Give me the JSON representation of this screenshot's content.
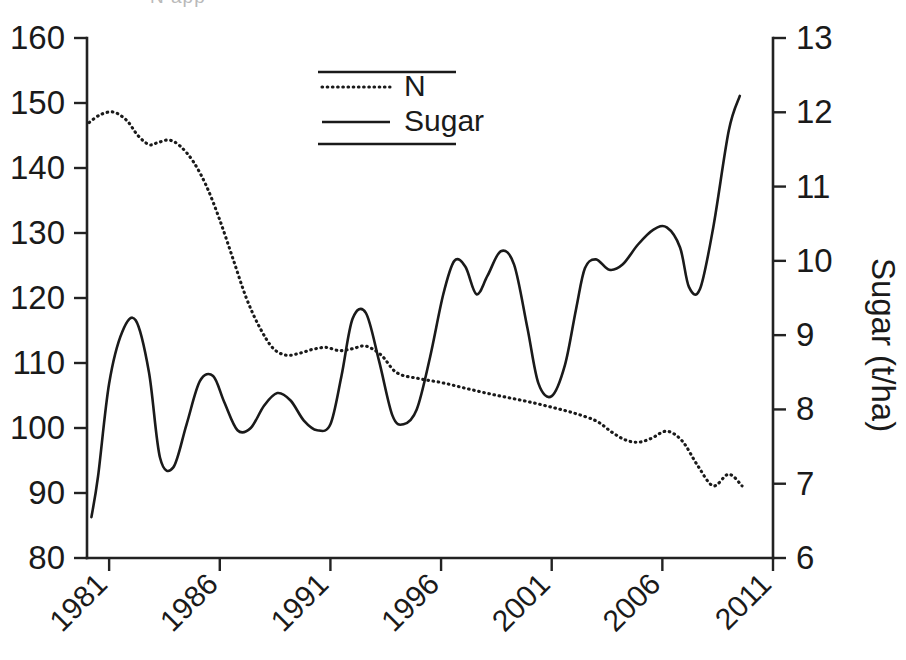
{
  "figure": {
    "clipped_top_text": "N app",
    "background": "#ffffff",
    "ink_color": "#1a1a1a"
  },
  "legend": {
    "position": "top-center-inside",
    "entries": [
      {
        "label": "N",
        "style": "dotted"
      },
      {
        "label": "Sugar",
        "style": "solid"
      }
    ]
  },
  "chart_data": {
    "type": "line",
    "title": "",
    "xlabel": "",
    "ylabel": "",
    "ylabel_left": "",
    "ylabel_right": "Sugar (t/ha)",
    "grid": false,
    "legend_position": "top-center",
    "xlim": [
      1980,
      2011
    ],
    "xticks": [
      1981,
      1986,
      1991,
      1996,
      2001,
      2006,
      2011
    ],
    "xtick_labels": [
      "1981",
      "1986",
      "1991",
      "1996",
      "2001",
      "2006",
      "2011"
    ],
    "xtick_rotation": -45,
    "ylim_left": [
      80,
      160
    ],
    "yticks_left": [
      80,
      90,
      100,
      110,
      120,
      130,
      140,
      150,
      160
    ],
    "ytick_labels_left": [
      "80",
      "90",
      "100",
      "110",
      "120",
      "130",
      "140",
      "150",
      "160"
    ],
    "ylim_right": [
      6,
      13
    ],
    "yticks_right": [
      6,
      7,
      8,
      9,
      10,
      11,
      12,
      13
    ],
    "ytick_labels_right": [
      "6",
      "7",
      "8",
      "9",
      "10",
      "11",
      "12",
      "13"
    ],
    "series": [
      {
        "name": "N",
        "style": "dotted",
        "axis": "left",
        "x": [
          1980.1,
          1980.6,
          1981.2,
          1981.8,
          1982.3,
          1982.8,
          1983.2,
          1983.7,
          1984.2,
          1984.8,
          1985.4,
          1986.0,
          1986.6,
          1987.2,
          1987.8,
          1988.4,
          1989.0,
          1989.6,
          1990.2,
          1990.8,
          1991.4,
          1992.0,
          1992.6,
          1993.3,
          1994.0,
          1995.0,
          1996.0,
          1997.0,
          1998.0,
          1999.0,
          2000.0,
          2001.0,
          2002.0,
          2003.0,
          2003.7,
          2004.3,
          2004.9,
          2005.5,
          2006.2,
          2006.9,
          2007.6,
          2008.3,
          2009.0,
          2009.6
        ],
        "y": [
          147.0,
          148.2,
          148.6,
          147.3,
          145.0,
          143.6,
          143.9,
          144.3,
          143.4,
          141.0,
          137.2,
          132.0,
          126.0,
          120.0,
          115.5,
          112.3,
          111.2,
          111.5,
          112.1,
          112.4,
          111.9,
          112.2,
          112.6,
          111.2,
          108.5,
          107.6,
          107.0,
          106.2,
          105.4,
          104.7,
          104.0,
          103.2,
          102.3,
          101.1,
          99.4,
          98.2,
          97.8,
          98.4,
          99.5,
          98.0,
          94.2,
          91.1,
          92.9,
          91.1
        ]
      },
      {
        "name": "Sugar",
        "style": "solid",
        "axis": "right",
        "x": [
          1980.2,
          1980.5,
          1981.0,
          1981.6,
          1982.2,
          1982.8,
          1983.3,
          1983.9,
          1984.5,
          1985.1,
          1985.7,
          1986.2,
          1986.8,
          1987.4,
          1988.0,
          1988.6,
          1989.2,
          1989.8,
          1990.4,
          1991.0,
          1991.5,
          1992.0,
          1992.6,
          1993.2,
          1993.8,
          1994.3,
          1994.9,
          1995.5,
          1996.1,
          1996.6,
          1997.1,
          1997.6,
          1998.1,
          1998.7,
          1999.3,
          1999.9,
          2000.4,
          2001.0,
          2001.6,
          2002.1,
          2002.5,
          2003.0,
          2003.6,
          2004.2,
          2004.9,
          2005.6,
          2006.2,
          2006.8,
          2007.2,
          2007.7,
          2008.3,
          2009.0,
          2009.5
        ],
        "y": [
          6.55,
          7.1,
          8.35,
          9.05,
          9.2,
          8.5,
          7.35,
          7.22,
          7.8,
          8.38,
          8.45,
          8.1,
          7.72,
          7.75,
          8.05,
          8.22,
          8.12,
          7.85,
          7.72,
          7.8,
          8.45,
          9.22,
          9.3,
          8.65,
          7.92,
          7.8,
          8.0,
          8.7,
          9.55,
          10.0,
          9.92,
          9.55,
          9.8,
          10.13,
          9.95,
          9.1,
          8.35,
          8.18,
          8.6,
          9.35,
          9.9,
          10.02,
          9.88,
          9.95,
          10.22,
          10.42,
          10.45,
          10.18,
          9.65,
          9.62,
          10.45,
          11.75,
          12.22
        ]
      }
    ]
  }
}
